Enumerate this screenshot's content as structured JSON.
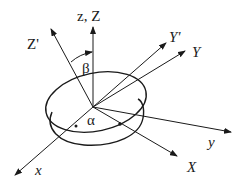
{
  "diagram": {
    "labels": {
      "zZ": "z, Z",
      "Zprime": "Z'",
      "Yprime": "Y'",
      "Y": "Y",
      "y": "y",
      "X": "X",
      "x": "x",
      "alpha": "α",
      "beta": "β"
    },
    "axes": [
      {
        "name": "z,Z",
        "from": [
          93,
          107
        ],
        "to": [
          93,
          27
        ]
      },
      {
        "name": "Z'",
        "from": [
          93,
          107
        ],
        "to": [
          51,
          29
        ]
      },
      {
        "name": "Y'",
        "from": [
          93,
          107
        ],
        "to": [
          166,
          43
        ]
      },
      {
        "name": "Y",
        "from": [
          93,
          107
        ],
        "to": [
          185,
          51
        ]
      },
      {
        "name": "y",
        "from": [
          93,
          107
        ],
        "to": [
          231,
          132
        ]
      },
      {
        "name": "X",
        "from": [
          93,
          107
        ],
        "to": [
          177,
          156
        ]
      },
      {
        "name": "x",
        "from": [
          93,
          107
        ],
        "to": [
          15,
          175
        ]
      }
    ],
    "angles": [
      {
        "name": "beta",
        "between": [
          "Z'",
          "Z"
        ]
      },
      {
        "name": "alpha",
        "between": [
          "x",
          "X"
        ]
      }
    ]
  }
}
